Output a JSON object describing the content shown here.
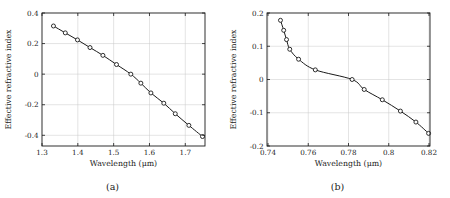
{
  "figure": {
    "panels": [
      {
        "id": "a",
        "caption": "(a)",
        "chart_data": {
          "type": "line",
          "title": "",
          "xlabel": "Wavelength (μm)",
          "ylabel": "Effective refractive index",
          "xlim": [
            1.3,
            1.755
          ],
          "ylim": [
            -0.47,
            0.4
          ],
          "xticks": [
            1.3,
            1.4,
            1.5,
            1.6,
            1.7
          ],
          "xtick_labels": [
            "1.3",
            "1.4",
            "1.5",
            "1.6",
            "1.7"
          ],
          "yticks": [
            0.4,
            0.2,
            0,
            -0.2,
            -0.4
          ],
          "ytick_labels": [
            "0.4",
            "0.2",
            "0",
            "-0.2",
            "-0.4"
          ],
          "grid": true,
          "legend": "none",
          "marker": "open-circle",
          "series": [
            {
              "name": "effective refractive index",
              "x": [
                1.332,
                1.365,
                1.399,
                1.434,
                1.47,
                1.508,
                1.548,
                1.576,
                1.604,
                1.64,
                1.672,
                1.71,
                1.748
              ],
              "y": [
                0.315,
                0.27,
                0.224,
                0.174,
                0.123,
                0.063,
                0.0,
                -0.059,
                -0.123,
                -0.19,
                -0.259,
                -0.335,
                -0.408
              ]
            }
          ]
        }
      },
      {
        "id": "b",
        "caption": "(b)",
        "chart_data": {
          "type": "line",
          "title": "",
          "xlabel": "Wavelength (μm)",
          "ylabel": "Effective refractive index",
          "xlim": [
            0.7395,
            0.8205
          ],
          "ylim": [
            -0.2,
            0.2
          ],
          "xticks": [
            0.74,
            0.76,
            0.78,
            0.8,
            0.82
          ],
          "xtick_labels": [
            "0.74",
            "0.76",
            "0.78",
            "0.8",
            "0.82"
          ],
          "yticks": [
            0.2,
            0.1,
            0,
            -0.1,
            -0.2
          ],
          "ytick_labels": [
            "0.2",
            "0.1",
            "0",
            "-0.1",
            "-0.2"
          ],
          "grid": true,
          "legend": "none",
          "marker": "open-circle",
          "series": [
            {
              "name": "effective refractive index",
              "x": [
                0.7462,
                0.7478,
                0.7492,
                0.7508,
                0.7552,
                0.7635,
                0.7818,
                0.7878,
                0.7968,
                0.8058,
                0.8135,
                0.8198
              ],
              "y": [
                0.178,
                0.148,
                0.12,
                0.091,
                0.061,
                0.029,
                0.0,
                -0.03,
                -0.061,
                -0.095,
                -0.128,
                -0.162
              ]
            }
          ]
        }
      }
    ]
  }
}
